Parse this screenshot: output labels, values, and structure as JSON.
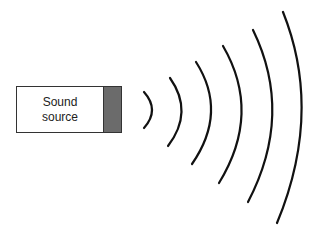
{
  "diagram": {
    "source": {
      "label_line1": "Sound",
      "label_line2": "source",
      "emitter_color": "#6b6b6b"
    },
    "waves": {
      "count": 6,
      "color": "#111111",
      "arcs": [
        {
          "d": "M144,92 Q160,110 144,128"
        },
        {
          "d": "M170,78 Q194,112 168,146"
        },
        {
          "d": "M196,62 Q228,112 192,164"
        },
        {
          "d": "M223,46 Q262,113 219,183"
        },
        {
          "d": "M253,30 Q294,114 248,202"
        },
        {
          "d": "M283,12 Q323,112 277,223"
        }
      ]
    }
  }
}
